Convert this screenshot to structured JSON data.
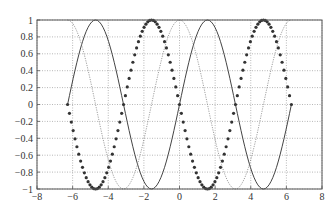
{
  "chart_data": {
    "type": "line",
    "title": "",
    "xlabel": "",
    "ylabel": "",
    "xlim": [
      -8,
      8
    ],
    "ylim": [
      -1,
      1
    ],
    "grid": true,
    "grid_style": "dotted",
    "legend": null,
    "x_ticks": [
      -8,
      -6,
      -4,
      -2,
      0,
      2,
      4,
      6,
      8
    ],
    "x_tick_labels": [
      "−8",
      "−6",
      "−4",
      "−2",
      "0",
      "2",
      "4",
      "6",
      "8"
    ],
    "y_ticks": [
      1,
      0.8,
      0.6,
      0.4,
      0.2,
      0,
      -0.2,
      -0.4,
      -0.6,
      -0.8,
      -1
    ],
    "y_tick_labels": [
      "1",
      "0.8",
      "0.6",
      "0.4",
      "0.2",
      "0",
      "−0.2",
      "−0.4",
      "−0.6",
      "−0.8",
      "−1"
    ],
    "x_range": [
      -6.2832,
      6.2832
    ],
    "series": [
      {
        "name": "sin(x)",
        "function": "sin",
        "style": "solid",
        "color": "#444444",
        "points": 120
      },
      {
        "name": "-sin(x)",
        "function": "neg_sin",
        "style": "markers",
        "marker": "*",
        "color": "#333333",
        "points": 120
      },
      {
        "name": "cos(x)",
        "function": "cos",
        "style": "dotted",
        "color": "#888888",
        "points": 120
      }
    ],
    "key_points": {
      "sin(x)": {
        "x": [
          -6.28,
          -4.71,
          -3.14,
          -1.57,
          0,
          1.57,
          3.14,
          4.71,
          6.28
        ],
        "y": [
          0,
          1,
          0,
          -1,
          0,
          1,
          0,
          -1,
          0
        ]
      },
      "-sin(x)": {
        "x": [
          -6.28,
          -4.71,
          -3.14,
          -1.57,
          0,
          1.57,
          3.14,
          4.71,
          6.28
        ],
        "y": [
          0,
          -1,
          0,
          1,
          0,
          -1,
          0,
          1,
          0
        ]
      },
      "cos(x)": {
        "x": [
          -6.28,
          -4.71,
          -3.14,
          -1.57,
          0,
          1.57,
          3.14,
          4.71,
          6.28
        ],
        "y": [
          1,
          0,
          -1,
          0,
          1,
          0,
          -1,
          0,
          1
        ]
      }
    }
  },
  "layout": {
    "plot_left": 37,
    "plot_right": 322,
    "plot_top": 20,
    "plot_bottom": 189
  }
}
